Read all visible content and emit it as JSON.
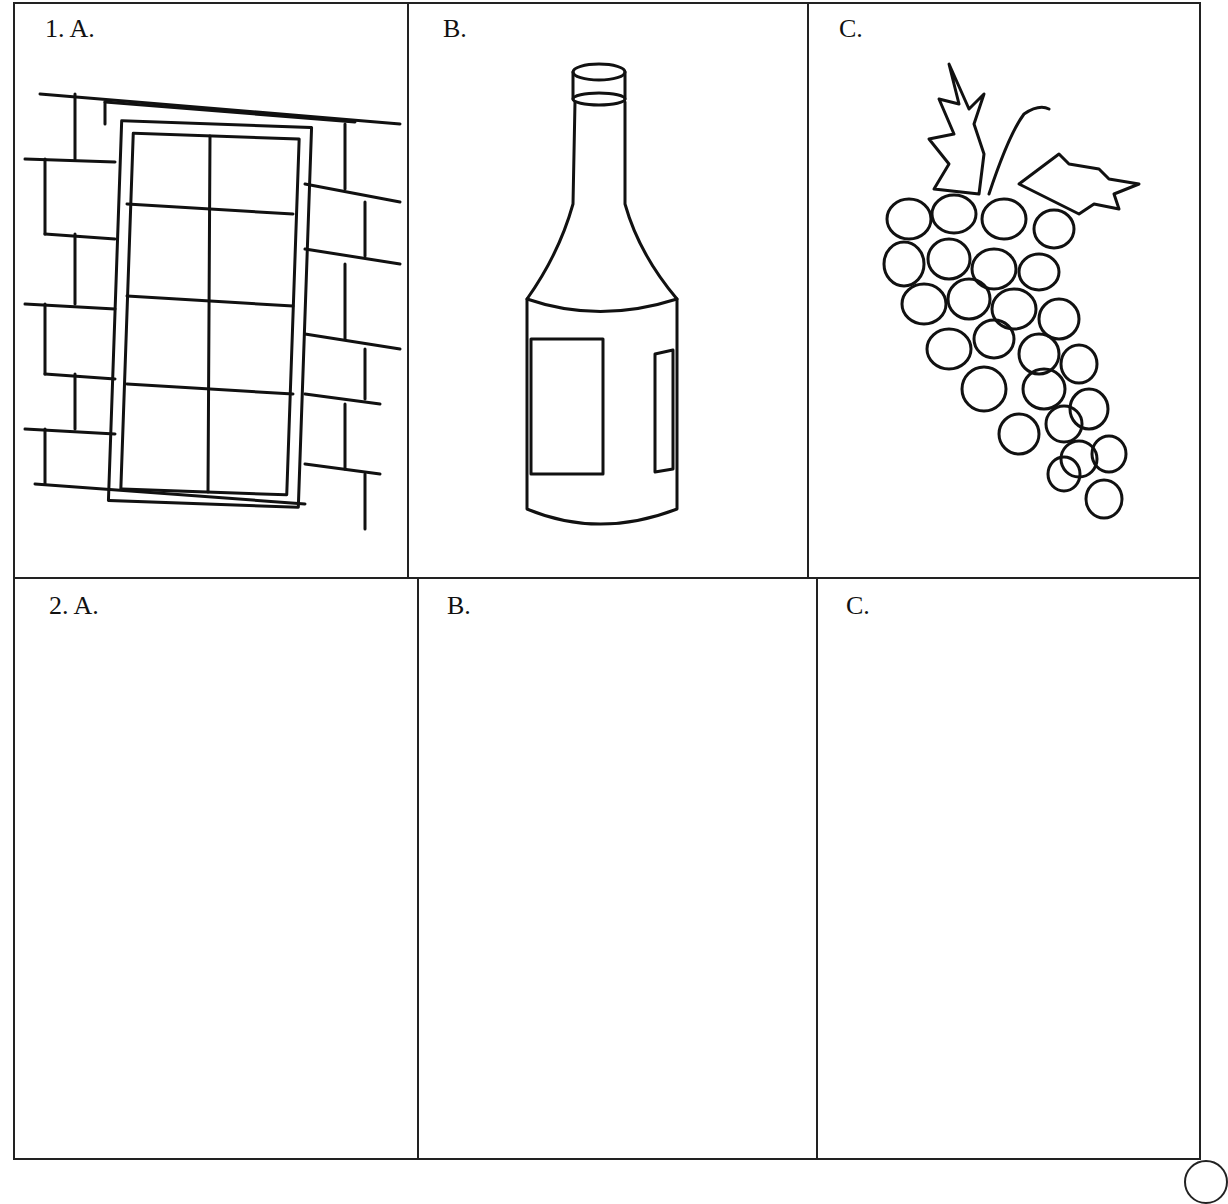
{
  "worksheet": {
    "rows": [
      {
        "number": "1.",
        "cells": [
          {
            "letter": "A.",
            "label": "1.  A.",
            "picture": "window-icon"
          },
          {
            "letter": "B.",
            "label": "B.",
            "picture": "bottle-icon"
          },
          {
            "letter": "C.",
            "label": "C.",
            "picture": "grapes-icon"
          }
        ]
      },
      {
        "number": "2.",
        "cells": [
          {
            "letter": "A.",
            "label": "2.  A.",
            "picture": ""
          },
          {
            "letter": "B.",
            "label": "B.",
            "picture": ""
          },
          {
            "letter": "C.",
            "label": "C.",
            "picture": ""
          }
        ]
      }
    ]
  }
}
